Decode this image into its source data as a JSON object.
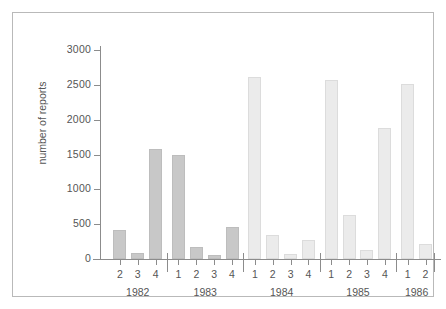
{
  "chart_data": {
    "type": "bar",
    "title": "",
    "subtitle": "",
    "xlabel": "",
    "ylabel": "number of reports",
    "ylim": [
      0,
      3000
    ],
    "ytick_labels": [
      "0",
      "500",
      "1000",
      "1500",
      "2000",
      "2500",
      "3000"
    ],
    "ytick_values": [
      0,
      500,
      1000,
      1500,
      2000,
      2500,
      3000
    ],
    "grid": false,
    "legend": null,
    "x_group_label": "year",
    "x_tick_label_kind": "quarter",
    "categories": [
      "1982 Q2",
      "1982 Q3",
      "1982 Q4",
      "1983 Q1",
      "1983 Q2",
      "1983 Q3",
      "1983 Q4",
      "1984 Q1",
      "1984 Q2",
      "1984 Q3",
      "1984 Q4",
      "1985 Q1",
      "1985 Q2",
      "1985 Q3",
      "1985 Q4",
      "1986 Q1",
      "1986 Q2"
    ],
    "values": [
      420,
      80,
      1580,
      1500,
      175,
      55,
      460,
      2610,
      345,
      70,
      270,
      2570,
      630,
      135,
      1880,
      2510,
      220
    ],
    "bars": [
      {
        "quarter": "2",
        "year": "1982",
        "value": 420,
        "shade": "dark"
      },
      {
        "quarter": "3",
        "year": "1982",
        "value": 80,
        "shade": "dark"
      },
      {
        "quarter": "4",
        "year": "1982",
        "value": 1580,
        "shade": "dark"
      },
      {
        "quarter": "1",
        "year": "1983",
        "value": 1500,
        "shade": "dark"
      },
      {
        "quarter": "2",
        "year": "1983",
        "value": 175,
        "shade": "dark"
      },
      {
        "quarter": "3",
        "year": "1983",
        "value": 55,
        "shade": "dark"
      },
      {
        "quarter": "4",
        "year": "1983",
        "value": 460,
        "shade": "dark"
      },
      {
        "quarter": "1",
        "year": "1984",
        "value": 2610,
        "shade": "light"
      },
      {
        "quarter": "2",
        "year": "1984",
        "value": 345,
        "shade": "light"
      },
      {
        "quarter": "3",
        "year": "1984",
        "value": 70,
        "shade": "light"
      },
      {
        "quarter": "4",
        "year": "1984",
        "value": 270,
        "shade": "light"
      },
      {
        "quarter": "1",
        "year": "1985",
        "value": 2570,
        "shade": "light"
      },
      {
        "quarter": "2",
        "year": "1985",
        "value": 630,
        "shade": "light"
      },
      {
        "quarter": "3",
        "year": "1985",
        "value": 135,
        "shade": "light"
      },
      {
        "quarter": "4",
        "year": "1985",
        "value": 1880,
        "shade": "light"
      },
      {
        "quarter": "1",
        "year": "1986",
        "value": 2510,
        "shade": "light"
      },
      {
        "quarter": "2",
        "year": "1986",
        "value": 220,
        "shade": "light"
      }
    ],
    "year_groups": [
      {
        "year": "1982",
        "quarters": [
          "2",
          "3",
          "4"
        ]
      },
      {
        "year": "1983",
        "quarters": [
          "1",
          "2",
          "3",
          "4"
        ]
      },
      {
        "year": "1984",
        "quarters": [
          "1",
          "2",
          "3",
          "4"
        ]
      },
      {
        "year": "1985",
        "quarters": [
          "1",
          "2",
          "3",
          "4"
        ]
      },
      {
        "year": "1986",
        "quarters": [
          "1",
          "2"
        ]
      }
    ],
    "colors": {
      "bar_dark_fill": "#c8c8c8",
      "bar_dark_edge": "#bdbdbd",
      "bar_light_fill": "#ebebeb",
      "bar_light_edge": "#dcdcdc",
      "axis": "#8c8c8c",
      "text": "#555555",
      "frame": "#b9b9b9",
      "background": "#ffffff"
    }
  }
}
